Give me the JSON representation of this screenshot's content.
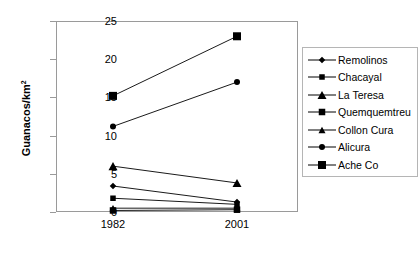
{
  "chart_data": {
    "type": "line",
    "title": "",
    "xlabel": "",
    "ylabel": "Guanacos/km²",
    "categories": [
      "1982",
      "2001"
    ],
    "x_tick_labels": [
      "1982",
      "2001"
    ],
    "y_tick_labels": [
      "0",
      "5",
      "10",
      "15",
      "20",
      "25"
    ],
    "y_ticks": [
      0,
      5,
      10,
      15,
      20,
      25
    ],
    "ylim": [
      0,
      25
    ],
    "grid": false,
    "legend_position": "right",
    "series": [
      {
        "name": "Remolinos",
        "marker": "diamond",
        "values": [
          3.4,
          1.3
        ]
      },
      {
        "name": "Chacayal",
        "marker": "square-small",
        "values": [
          1.8,
          1.0
        ]
      },
      {
        "name": "La Teresa",
        "marker": "triangle",
        "values": [
          6.0,
          3.8
        ]
      },
      {
        "name": "Quemquemtreu",
        "marker": "square-medium",
        "values": [
          0.2,
          0.3
        ]
      },
      {
        "name": "Collon Cura",
        "marker": "triangle-small",
        "values": [
          0.5,
          0.5
        ]
      },
      {
        "name": "Alicura",
        "marker": "circle",
        "values": [
          11.2,
          17.0
        ]
      },
      {
        "name": "Ache Co",
        "marker": "square-large",
        "values": [
          15.2,
          23.0
        ]
      }
    ],
    "colors": {
      "series": "#000000",
      "axis": "#9a9a9a",
      "background": "#ffffff",
      "legend_border": "#b5b5b5"
    }
  },
  "axis": {
    "y_title_main": "Guanacos/km",
    "y_title_sup": "2"
  }
}
